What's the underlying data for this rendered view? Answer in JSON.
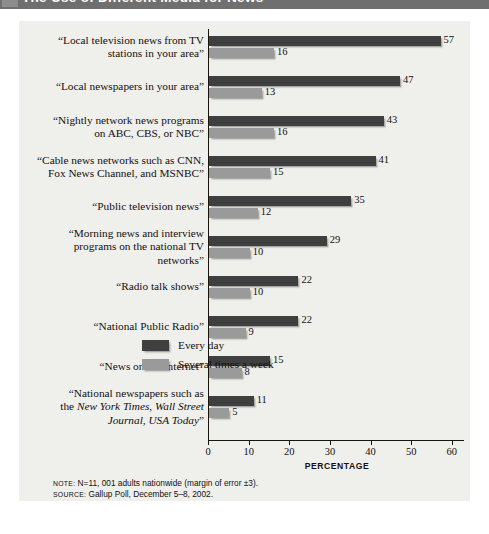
{
  "header": {
    "title": "The Use of Different Media for News"
  },
  "chart_data": {
    "type": "bar",
    "orientation": "horizontal",
    "title": "The Use of Different Media for News",
    "xlabel": "PERCENTAGE",
    "ylabel": "",
    "xlim": [
      0,
      63
    ],
    "xticks": [
      "0",
      "10",
      "20",
      "30",
      "40",
      "50",
      "60"
    ],
    "xtick_values": [
      0,
      10,
      20,
      30,
      40,
      50,
      60
    ],
    "grid": false,
    "legend_position": "center-right",
    "categories": [
      "“Local television news from TV stations in your area”",
      "“Local newspapers in your area”",
      "“Nightly network news programs on ABC, CBS,  or NBC”",
      "“Cable news networks such as CNN, Fox News Channel, and MSNBC”",
      "“Public television news”",
      "“Morning news and interview programs on the national TV networks”",
      "“Radio talk shows”",
      "“National Public Radio”",
      "“News on the Internet”",
      "“National newspapers such as the New York Times, Wall Street Journal, USA Today”"
    ],
    "series": [
      {
        "name": "Every day",
        "color": "#3f3f3f",
        "values": [
          57,
          47,
          43,
          41,
          35,
          29,
          22,
          22,
          15,
          11
        ]
      },
      {
        "name": "Several times a week",
        "color": "#9a9a9a",
        "values": [
          16,
          13,
          16,
          15,
          12,
          10,
          10,
          9,
          8,
          5
        ]
      }
    ]
  },
  "categories_html": [
    "“Local television news from TV<br>stations in your area”",
    "“Local newspapers in your area”",
    "“Nightly network news programs<br>on ABC, CBS,  or NBC”",
    "“Cable news networks such as CNN,<br>Fox News Channel, and MSNBC”",
    "“Public television news”",
    "“Morning news and interview<br>programs on the national TV<br>networks”",
    "“Radio talk shows”",
    "“National Public Radio”",
    "“News on the Internet”",
    "“National newspapers such as<br>the <i>New York Times, Wall Street<br>Journal, USA Today</i>”"
  ],
  "footnotes": {
    "note_kicker": "NOTE:",
    "note_text": " N=11, 001 adults nationwide (margin of error ±3).",
    "source_kicker": "SOURCE:",
    "source_text": " Gallup Poll, December 5–8, 2002."
  }
}
